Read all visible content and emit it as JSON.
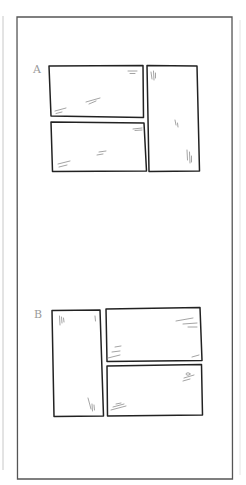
{
  "page": {
    "colors": {
      "ink": "#2a2a2a",
      "frame": "#555555",
      "hatch": "#9a9a9a",
      "label": "#9a9a9a",
      "background": "#ffffff"
    }
  },
  "layouts": [
    {
      "id": "A",
      "label": "A",
      "panels": [
        {
          "name": "panel-a-top-left",
          "role": "wide horizontal panel"
        },
        {
          "name": "panel-a-bottom-left",
          "role": "wide horizontal panel"
        },
        {
          "name": "panel-a-right",
          "role": "tall vertical panel"
        }
      ]
    },
    {
      "id": "B",
      "label": "B",
      "panels": [
        {
          "name": "panel-b-left",
          "role": "tall vertical panel"
        },
        {
          "name": "panel-b-top-right",
          "role": "wide horizontal panel"
        },
        {
          "name": "panel-b-bottom-right",
          "role": "wide horizontal panel"
        }
      ]
    }
  ]
}
